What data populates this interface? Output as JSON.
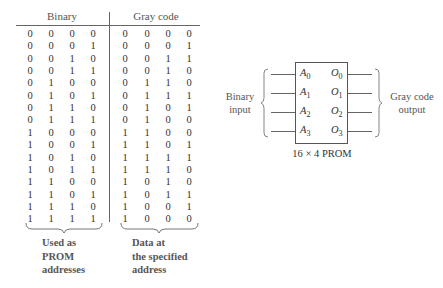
{
  "table": {
    "headers": {
      "binary": "Binary",
      "gray": "Gray code"
    },
    "binary_rows": [
      [
        "0",
        "0",
        "0",
        "0"
      ],
      [
        "0",
        "0",
        "0",
        "1"
      ],
      [
        "0",
        "0",
        "1",
        "0"
      ],
      [
        "0",
        "0",
        "1",
        "1"
      ],
      [
        "0",
        "1",
        "0",
        "0"
      ],
      [
        "0",
        "1",
        "0",
        "1"
      ],
      [
        "0",
        "1",
        "1",
        "0"
      ],
      [
        "0",
        "1",
        "1",
        "1"
      ],
      [
        "1",
        "0",
        "0",
        "0"
      ],
      [
        "1",
        "0",
        "0",
        "1"
      ],
      [
        "1",
        "0",
        "1",
        "0"
      ],
      [
        "1",
        "0",
        "1",
        "1"
      ],
      [
        "1",
        "1",
        "0",
        "0"
      ],
      [
        "1",
        "1",
        "0",
        "1"
      ],
      [
        "1",
        "1",
        "1",
        "0"
      ],
      [
        "1",
        "1",
        "1",
        "1"
      ]
    ],
    "gray_rows": [
      [
        "0",
        "0",
        "0",
        "0"
      ],
      [
        "0",
        "0",
        "0",
        "1"
      ],
      [
        "0",
        "0",
        "1",
        "1"
      ],
      [
        "0",
        "0",
        "1",
        "0"
      ],
      [
        "0",
        "1",
        "1",
        "0"
      ],
      [
        "0",
        "1",
        "1",
        "1"
      ],
      [
        "0",
        "1",
        "0",
        "1"
      ],
      [
        "0",
        "1",
        "0",
        "0"
      ],
      [
        "1",
        "1",
        "0",
        "0"
      ],
      [
        "1",
        "1",
        "0",
        "1"
      ],
      [
        "1",
        "1",
        "1",
        "1"
      ],
      [
        "1",
        "1",
        "1",
        "0"
      ],
      [
        "1",
        "0",
        "1",
        "0"
      ],
      [
        "1",
        "0",
        "1",
        "1"
      ],
      [
        "1",
        "0",
        "0",
        "1"
      ],
      [
        "1",
        "0",
        "0",
        "0"
      ]
    ],
    "captions": {
      "binary": [
        "Used as",
        "PROM",
        "addresses"
      ],
      "gray": [
        "Data at",
        "the specified",
        "address"
      ]
    }
  },
  "chip": {
    "name": "16 × 4 PROM",
    "inputs": [
      {
        "letter": "A",
        "sub": "0"
      },
      {
        "letter": "A",
        "sub": "1"
      },
      {
        "letter": "A",
        "sub": "2"
      },
      {
        "letter": "A",
        "sub": "3"
      }
    ],
    "outputs": [
      {
        "letter": "O",
        "sub": "0"
      },
      {
        "letter": "O",
        "sub": "1"
      },
      {
        "letter": "O",
        "sub": "2"
      },
      {
        "letter": "O",
        "sub": "3"
      }
    ],
    "input_label": [
      "Binary",
      "input"
    ],
    "output_label": [
      "Gray code",
      "output"
    ]
  }
}
